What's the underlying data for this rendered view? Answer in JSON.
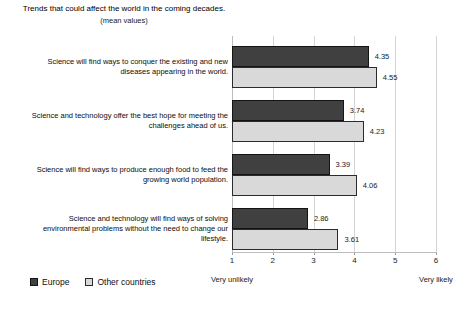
{
  "title": "Trends that could affect the world in the coming decades.",
  "subtitle": "(mean values)",
  "legend": [
    {
      "label": "Europe",
      "color": "#404040",
      "border": "#141414"
    },
    {
      "label": "Other countries",
      "color": "#d9d9d9",
      "border": "#2b2b2b"
    }
  ],
  "axis": {
    "min_label": "Very unlikely",
    "max_label": "Very likely"
  },
  "display": {
    "category_lines": [
      [
        "Science will find ways to conquer the existing and new",
        "diseases appearing in the world."
      ],
      [
        "Science and technology offer the best hope for meeting the",
        "challenges ahead of us."
      ],
      [
        "Science will find ways to produce enough food to feed the",
        "growing world population."
      ],
      [
        "Science and technology will find ways of solving",
        "environmental problems without the need to change our",
        "lifestyle."
      ]
    ]
  },
  "chart_data": {
    "type": "bar",
    "orientation": "horizontal",
    "title": "Trends that could affect the world in the coming decades.",
    "subtitle": "(mean values)",
    "categories": [
      "Science will find ways to conquer the existing and new diseases appearing in the world.",
      "Science and technology offer the best hope for meeting the challenges ahead of us.",
      "Science will find ways to produce enough food to feed the growing world population.",
      "Science and technology will find ways of solving environmental problems without the need to change our lifestyle."
    ],
    "series": [
      {
        "name": "Europe",
        "color": "#404040",
        "values": [
          4.35,
          3.74,
          3.39,
          2.86
        ]
      },
      {
        "name": "Other countries",
        "color": "#d9d9d9",
        "values": [
          4.55,
          4.23,
          4.06,
          3.61
        ]
      }
    ],
    "value_labels": true,
    "xlim": [
      1,
      6
    ],
    "x_ticks": [
      1,
      2,
      3,
      4,
      5,
      6
    ],
    "x_min_annotation": "Very unlikely",
    "x_max_annotation": "Very likely",
    "grid": true,
    "legend_position": "bottom-left"
  }
}
